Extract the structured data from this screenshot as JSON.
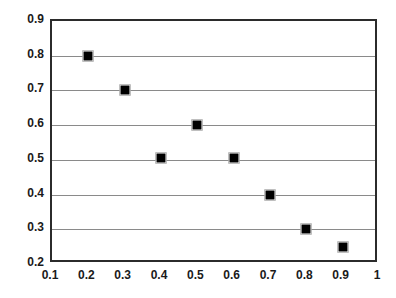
{
  "chart_data": {
    "type": "scatter",
    "title": "",
    "subtitle": "",
    "xlabel": "",
    "ylabel": "",
    "xlim": [
      0.1,
      1.0
    ],
    "ylim": [
      0.2,
      0.9
    ],
    "xticks": [
      "0.1",
      "0.2",
      "0.3",
      "0.4",
      "0.5",
      "0.6",
      "0.7",
      "0.8",
      "0.9",
      "1"
    ],
    "xtick_values": [
      0.1,
      0.2,
      0.3,
      0.4,
      0.5,
      0.6,
      0.7,
      0.8,
      0.9,
      1.0
    ],
    "yticks": [
      "0.2",
      "0.3",
      "0.4",
      "0.5",
      "0.6",
      "0.7",
      "0.8",
      "0.9"
    ],
    "ytick_values": [
      0.2,
      0.3,
      0.4,
      0.5,
      0.6,
      0.7,
      0.8,
      0.9
    ],
    "grid": {
      "horizontal": true,
      "vertical": false,
      "horizontal_values": [
        0.3,
        0.4,
        0.5,
        0.6,
        0.7,
        0.8
      ],
      "color": "#8a8a8a"
    },
    "legend": null,
    "annotations": [],
    "marker": {
      "shape": "square",
      "color": "#000000",
      "size_px": 9
    },
    "frame_color": "#2b2b2b",
    "background": "#ffffff",
    "series": [
      {
        "name": "series-1",
        "points": [
          {
            "x": 0.2,
            "y": 0.8
          },
          {
            "x": 0.3,
            "y": 0.7
          },
          {
            "x": 0.4,
            "y": 0.505
          },
          {
            "x": 0.5,
            "y": 0.6
          },
          {
            "x": 0.6,
            "y": 0.505
          },
          {
            "x": 0.7,
            "y": 0.4
          },
          {
            "x": 0.8,
            "y": 0.3
          },
          {
            "x": 0.9,
            "y": 0.25
          }
        ]
      }
    ]
  }
}
